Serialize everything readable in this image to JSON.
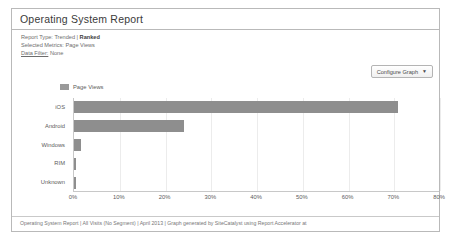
{
  "panel": {
    "title": "Operating System Report"
  },
  "meta": {
    "report_type_label": "Report Type:",
    "report_type_option_a": "Trended",
    "report_type_separator": "|",
    "report_type_option_b": "Ranked",
    "selected_metrics_label": "Selected Metrics:",
    "selected_metrics_value": "Page Views",
    "data_filter_label": "Data Filter:",
    "data_filter_value": "None"
  },
  "toolbar": {
    "configure_graph_label": "Configure Graph",
    "caret_glyph": "▼"
  },
  "footer": {
    "caption": "Operating System Report | All Visits (No Segment) | April 2013 | Graph generated by SiteCatalyst using Report Accelerator at"
  },
  "colors": {
    "bar": "#8e8e8e",
    "legend_swatch": "#9a9a9a",
    "grid": "#ececec",
    "axis": "#c8c8c8",
    "panel_border": "#b9b9b9",
    "text": "#5c5c5c",
    "title_text": "#3a3a3a"
  },
  "chart_data": {
    "type": "bar",
    "orientation": "horizontal",
    "title": "",
    "xlabel": "",
    "ylabel": "",
    "categories": [
      "iOS",
      "Android",
      "Windows",
      "RIM",
      "Unknown"
    ],
    "values": [
      70.8,
      24.0,
      1.5,
      0.4,
      0.4
    ],
    "value_suffix": "%",
    "xlim": [
      0,
      80
    ],
    "xticks": [
      0,
      10,
      20,
      30,
      40,
      50,
      60,
      70,
      80
    ],
    "xtick_labels": [
      "0%",
      "10%",
      "20%",
      "30%",
      "40%",
      "50%",
      "60%",
      "70%",
      "80%"
    ],
    "grid": true,
    "legend": [
      "Page Views"
    ],
    "legend_position": "top-left",
    "series": [
      {
        "name": "Page Views",
        "values": [
          70.8,
          24.0,
          1.5,
          0.4,
          0.4
        ]
      }
    ]
  }
}
